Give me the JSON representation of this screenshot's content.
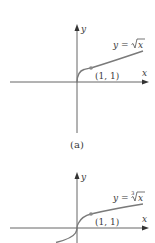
{
  "figure": {
    "graphs": [
      {
        "id": "a",
        "function": "y = sqrt(x)",
        "label_prefix": "y = ",
        "label_var": "x",
        "root_index": "",
        "point_label": "(1, 1)",
        "x_axis_label": "x",
        "y_axis_label": "y",
        "caption": "(a)"
      },
      {
        "id": "b",
        "function": "y = cbrt(x)",
        "label_prefix": "y = ",
        "label_var": "x",
        "root_index": "3",
        "point_label": "(1, 1)",
        "x_axis_label": "x",
        "y_axis_label": "y",
        "caption": ""
      }
    ],
    "colors": {
      "axis": "#555555",
      "curve": "#7a7a7a",
      "point": "#8a8a8a",
      "text": "#3a3a3a"
    }
  }
}
